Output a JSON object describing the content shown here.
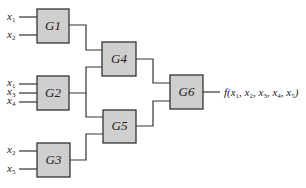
{
  "diagram": {
    "gates": [
      {
        "id": "G1",
        "label": "G1",
        "x": 37,
        "y": 9,
        "w": 32,
        "h": 34
      },
      {
        "id": "G2",
        "label": "G2",
        "x": 37,
        "y": 76,
        "w": 32,
        "h": 34
      },
      {
        "id": "G3",
        "label": "G3",
        "x": 37,
        "y": 143,
        "w": 33,
        "h": 34
      },
      {
        "id": "G4",
        "label": "G4",
        "x": 102,
        "y": 42,
        "w": 34,
        "h": 34
      },
      {
        "id": "G5",
        "label": "G5",
        "x": 103,
        "y": 110,
        "w": 33,
        "h": 33
      },
      {
        "id": "G6",
        "label": "G6",
        "x": 170,
        "y": 75,
        "w": 33,
        "h": 34
      }
    ],
    "inputs": {
      "G1": [
        {
          "var": "x",
          "sub": "1"
        },
        {
          "var": "x",
          "sub": "2"
        }
      ],
      "G2": [
        {
          "var": "x",
          "sub": "1"
        },
        {
          "var": "x",
          "sub": "3"
        },
        {
          "var": "x",
          "sub": "4"
        }
      ],
      "G3": [
        {
          "var": "x",
          "sub": "2"
        },
        {
          "var": "x",
          "sub": "5"
        }
      ]
    },
    "connections": [
      {
        "from": "G1",
        "to": "G4"
      },
      {
        "from": "G2",
        "to": "G4"
      },
      {
        "from": "G2",
        "to": "G5"
      },
      {
        "from": "G3",
        "to": "G5"
      },
      {
        "from": "G4",
        "to": "G6"
      },
      {
        "from": "G5",
        "to": "G6"
      }
    ],
    "output": {
      "label": "f(x1, x2, x3, x4, x5)",
      "func": "f",
      "args": [
        "1",
        "2",
        "3",
        "4",
        "5"
      ]
    }
  }
}
